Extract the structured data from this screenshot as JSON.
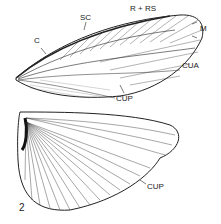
{
  "figure": {
    "number": "2",
    "forewing_labels": {
      "c": "C",
      "sc": "SC",
      "r_rs": "R + RS",
      "m": "M",
      "cua": "CUA",
      "cup": "CUP"
    },
    "hindwing_labels": {
      "cup": "CUP"
    },
    "colors": {
      "ink": "#222222",
      "background": "#ffffff"
    }
  }
}
